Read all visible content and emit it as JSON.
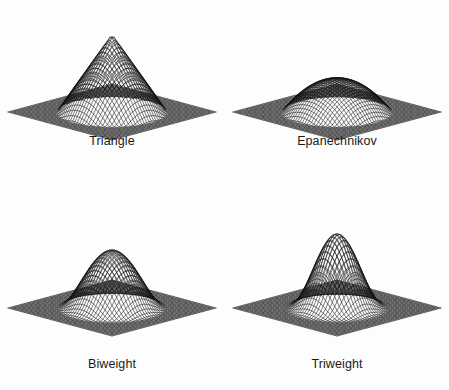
{
  "figure": {
    "background_color": "#fdfdfd",
    "ink_color": "#121212",
    "width": 449,
    "height": 390,
    "layout": "2x2 grid of 3-D wireframe surface plots"
  },
  "panels": [
    {
      "caption": "Triangle",
      "kernel": "triangle"
    },
    {
      "caption": "Epanechnikov",
      "kernel": "epanechnikov"
    },
    {
      "caption": "Biweight",
      "kernel": "biweight"
    },
    {
      "caption": "Triweight",
      "kernel": "triweight"
    }
  ],
  "chart_data": {
    "type": "line",
    "title": "",
    "subtitle": "",
    "xlabel": "",
    "ylabel": "",
    "grid": false,
    "legend_position": "none",
    "plot_kind": "3d-wireframe-mesh-surface",
    "panel_layout": {
      "rows": 2,
      "cols": 2
    },
    "projection": {
      "type": "oblique-isometric",
      "x_axis_screen": [
        0.5,
        0.26
      ],
      "y_axis_screen": [
        -0.5,
        0.26
      ],
      "z_axis_screen": [
        0.0,
        -1.0
      ],
      "elevation_deg": 28,
      "azimuth_deg": 45
    },
    "domain": {
      "u": [
        -1.35,
        1.35
      ],
      "v": [
        -1.35,
        1.35
      ]
    },
    "mesh": {
      "u_lines": 46,
      "v_lines": 46
    },
    "zlim": [
      0,
      1
    ],
    "panels": [
      {
        "label": "Triangle",
        "formula": "K(r) = (1 - r)  for r <= 1, else 0",
        "peak_height": 1.0,
        "peak_shape": "sharp cone / pyramid apex",
        "support_radius": 1.0,
        "relative_peak_screen_height": 1.0
      },
      {
        "label": "Epanechnikov",
        "formula": "K(r) = (1 - r^2)  for r <= 1, else 0",
        "peak_height": 1.0,
        "peak_shape": "broad flat dome",
        "support_radius": 1.0,
        "relative_peak_screen_height": 0.42
      },
      {
        "label": "Biweight",
        "formula": "K(r) = (1 - r^2)^2  for r <= 1, else 0",
        "peak_height": 1.0,
        "peak_shape": "smooth rounded bell",
        "support_radius": 1.0,
        "relative_peak_screen_height": 0.74
      },
      {
        "label": "Triweight",
        "formula": "K(r) = (1 - r^2)^3  for r <= 1, else 0",
        "peak_height": 1.0,
        "peak_shape": "narrow tall bell",
        "support_radius": 1.0,
        "relative_peak_screen_height": 0.95
      }
    ]
  }
}
